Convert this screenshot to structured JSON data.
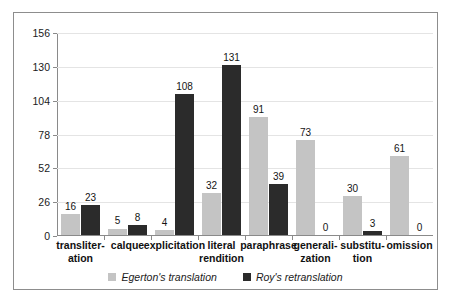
{
  "chart_data": {
    "type": "bar",
    "title": "",
    "subtitle": "",
    "xlabel": "",
    "ylabel": "",
    "ylim": [
      0,
      156
    ],
    "yticks": [
      0,
      26,
      52,
      78,
      104,
      130,
      156
    ],
    "grid": true,
    "legend_position": "bottom",
    "categories": [
      "transliter-\nation",
      "calque",
      "explicitation",
      "literal\nrendition",
      "paraphrase",
      "generali-\nzation",
      "substitu-\ntion",
      "omission"
    ],
    "series": [
      {
        "name": "Egerton's translation",
        "color": "#c4c4c4",
        "values": [
          16,
          5,
          4,
          32,
          91,
          73,
          30,
          61
        ]
      },
      {
        "name": "Roy's retranslation",
        "color": "#2b2b2b",
        "values": [
          23,
          8,
          108,
          131,
          39,
          0,
          3,
          0
        ]
      }
    ]
  },
  "legend": {
    "items": [
      {
        "label": "Egerton's translation",
        "color": "#c4c4c4"
      },
      {
        "label": "Roy's retranslation",
        "color": "#2b2b2b"
      }
    ]
  },
  "colors": {
    "series_a": "#c4c4c4",
    "series_b": "#2b2b2b",
    "axis": "#8a8a8a",
    "gridline": "#e4e4e4",
    "frame": "#8d8d8d",
    "text": "#1a1a1a"
  }
}
